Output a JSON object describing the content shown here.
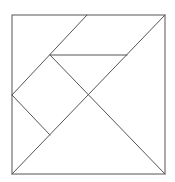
{
  "diagram": {
    "type": "tangram-square",
    "stroke_color": "#555555",
    "background": "#ffffff",
    "outer_square": {
      "x": 12,
      "y": 15,
      "w": 153,
      "h": 159
    },
    "lines": [
      {
        "name": "diagonal-main",
        "x1": 12,
        "y1": 174,
        "x2": 165,
        "y2": 15
      },
      {
        "name": "diagonal-secondary",
        "x1": 50,
        "y1": 55,
        "x2": 165,
        "y2": 174
      },
      {
        "name": "top-parallelogram-left-edge",
        "x1": 87,
        "y1": 15,
        "x2": 12,
        "y2": 95
      },
      {
        "name": "small-triangle-top-edge",
        "x1": 50,
        "y1": 55,
        "x2": 127,
        "y2": 55
      },
      {
        "name": "square-lower-edge",
        "x1": 12,
        "y1": 95,
        "x2": 50,
        "y2": 135
      }
    ]
  }
}
